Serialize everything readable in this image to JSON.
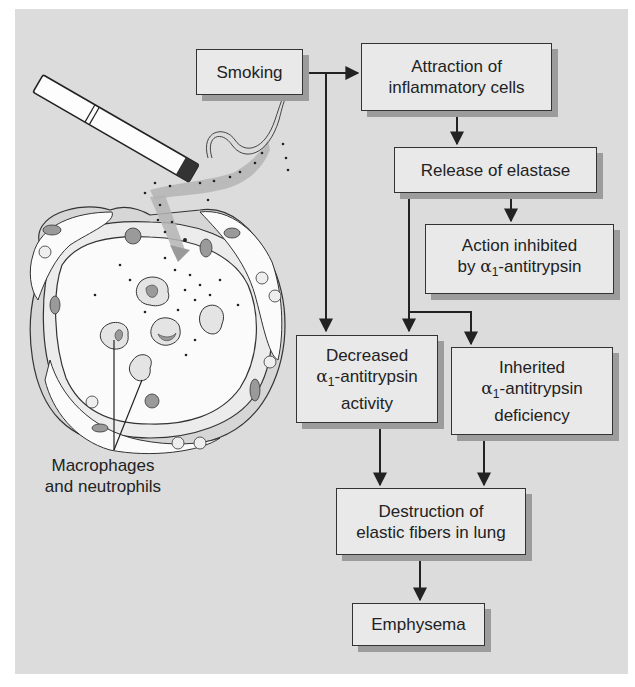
{
  "diagram": {
    "type": "flowchart",
    "topic": "Pathogenesis of emphysema",
    "illustration": {
      "description": "Cigarette emitting smoke into a lung alveolus containing inflammatory cells",
      "label_line1": "Macrophages",
      "label_line2": "and neutrophils"
    },
    "nodes": {
      "smoking": {
        "line1": "Smoking"
      },
      "attraction": {
        "line1": "Attraction of",
        "line2": "inflammatory cells"
      },
      "release": {
        "line1": "Release of elastase"
      },
      "inhibited": {
        "line1": "Action inhibited",
        "line2_prefix": "by ",
        "alpha": "α",
        "sub": "1",
        "line2_suffix": "-antitrypsin"
      },
      "decreased": {
        "line1": "Decreased",
        "alpha": "α",
        "sub": "1",
        "line2_suffix": "-antitrypsin",
        "line3": "activity"
      },
      "inherited": {
        "line1": "Inherited",
        "alpha": "α",
        "sub": "1",
        "line2_suffix": "-antitrypsin",
        "line3": "deficiency"
      },
      "destruction": {
        "line1": "Destruction of",
        "line2": "elastic fibers in lung"
      },
      "emphysema": {
        "line1": "Emphysema"
      }
    },
    "edges": [
      [
        "smoking",
        "attraction"
      ],
      [
        "smoking",
        "decreased"
      ],
      [
        "attraction",
        "release"
      ],
      [
        "release",
        "inhibited"
      ],
      [
        "release",
        "decreased"
      ],
      [
        "release",
        "inherited"
      ],
      [
        "decreased",
        "destruction"
      ],
      [
        "inherited",
        "destruction"
      ],
      [
        "destruction",
        "emphysema"
      ]
    ],
    "colors": {
      "background": "#dcdcdc",
      "box_fill": "#e9e9e9",
      "box_shadow": "#9c9c9c",
      "line": "#222222",
      "smoke": "#b4b4b4"
    }
  }
}
